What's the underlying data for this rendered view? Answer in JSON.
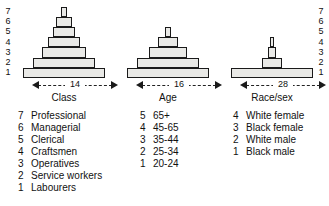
{
  "figure": {
    "axis_left_ticks": [
      "7",
      "6",
      "5",
      "4",
      "3",
      "2",
      "1"
    ],
    "axis_right_ticks": [
      "7",
      "6",
      "5",
      "4",
      "3",
      "2",
      "1"
    ]
  },
  "chart_data": {
    "type": "bar",
    "title": "",
    "xlabel": "",
    "ylabel": "",
    "orientation": "stacked-pyramid",
    "ylim": [
      1,
      7
    ],
    "grid": false,
    "legend_position": "below",
    "panels": [
      {
        "name": "Class",
        "label": "Class",
        "base_width_label": "14",
        "base_width": 14,
        "levels": [
          1,
          2,
          3,
          4,
          5,
          6,
          7
        ],
        "widths": [
          14,
          10.5,
          7.6,
          5.4,
          3.9,
          2.6,
          1.0
        ],
        "categories": [
          "1",
          "2",
          "3",
          "4",
          "5",
          "6",
          "7"
        ],
        "values": [
          14,
          10.5,
          7.6,
          5.4,
          3.9,
          2.6,
          1.0
        ],
        "legend": [
          {
            "key": "7",
            "label": "Professional"
          },
          {
            "key": "6",
            "label": "Managerial"
          },
          {
            "key": "5",
            "label": "Clerical"
          },
          {
            "key": "4",
            "label": "Craftsmen"
          },
          {
            "key": "3",
            "label": "Operatives"
          },
          {
            "key": "2",
            "label": "Service workers"
          },
          {
            "key": "1",
            "label": "Labourers"
          }
        ]
      },
      {
        "name": "Age",
        "label": "Age",
        "base_width_label": "16",
        "base_width": 16,
        "levels": [
          1,
          2,
          3,
          4,
          5
        ],
        "widths": [
          16,
          12.1,
          7.3,
          4.0,
          1.2
        ],
        "categories": [
          "1",
          "2",
          "3",
          "4",
          "5"
        ],
        "values": [
          16,
          12.1,
          7.3,
          4.0,
          1.2
        ],
        "legend": [
          {
            "key": "5",
            "label": "65+"
          },
          {
            "key": "4",
            "label": "45-65"
          },
          {
            "key": "3",
            "label": "35-44"
          },
          {
            "key": "2",
            "label": "25-34"
          },
          {
            "key": "1",
            "label": "20-24"
          }
        ]
      },
      {
        "name": "Race/sex",
        "label": "Race/sex",
        "base_width_label": "28",
        "base_width": 28,
        "levels": [
          1,
          2,
          3,
          4
        ],
        "widths": [
          28,
          6.6,
          3.0,
          1.0
        ],
        "categories": [
          "1",
          "2",
          "3",
          "4"
        ],
        "values": [
          28,
          6.6,
          3.0,
          1.0
        ],
        "legend": [
          {
            "key": "4",
            "label": "White female"
          },
          {
            "key": "3",
            "label": "Black female"
          },
          {
            "key": "2",
            "label": "White male"
          },
          {
            "key": "1",
            "label": "Black male"
          }
        ]
      }
    ]
  }
}
